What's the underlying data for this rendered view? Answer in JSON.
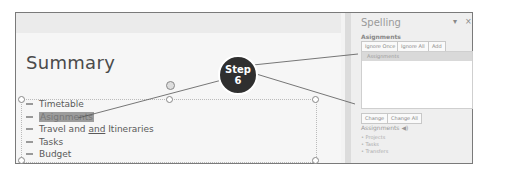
{
  "slide": {
    "title": "Summary",
    "bullets": [
      {
        "text": "Timetable",
        "selected": false
      },
      {
        "text": "Asignments",
        "selected": true
      },
      {
        "text_before": "Travel and ",
        "text_underlined": "and",
        "text_after": " Itineraries",
        "selected": false
      },
      {
        "text": "Tasks",
        "selected": false
      },
      {
        "text": "Budget",
        "selected": false
      }
    ]
  },
  "callout": {
    "line1": "Step",
    "line2": "6"
  },
  "spelling_pane": {
    "title": "Spelling",
    "dropdown_icon": "chevron-down-icon",
    "close_icon": "close-icon",
    "misspelled_word": "Asignments",
    "buttons": {
      "ignore_once": "Ignore Once",
      "ignore_all": "Ignore All",
      "add": "Add",
      "change": "Change",
      "change_all": "Change All"
    },
    "suggestions": [
      "Assignments"
    ],
    "definition": {
      "word": "Assignments",
      "speaker_icon": "speaker-icon",
      "synonyms": [
        "Projects",
        "Tasks",
        "Transfers"
      ]
    }
  }
}
